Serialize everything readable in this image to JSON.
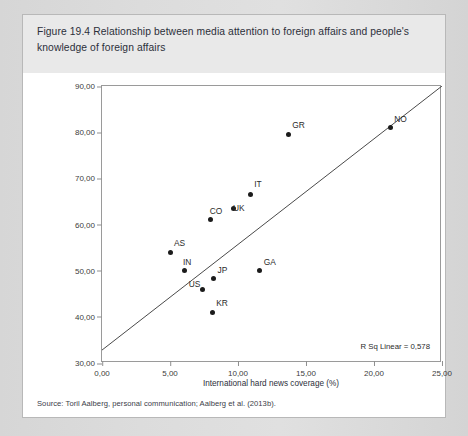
{
  "figure": {
    "caption": "Figure 19.4  Relationship between media attention to foreign affairs and people's knowledge of foreign affairs",
    "source": "Source: Toril Aalberg, personal communication; Aalberg et al. (2013b)."
  },
  "colors": {
    "page_background": "#d9d9d9",
    "figure_background": "#ffffff",
    "header_background": "#e9e9e9",
    "frame_border": "#9a9a9a",
    "point_fill": "#1b1b1b",
    "line_stroke": "#4a4a4a",
    "text": "#2c2f3a"
  },
  "chart_data": {
    "type": "scatter",
    "title": "",
    "xlabel": "International hard news coverage (%)",
    "ylabel": "International hard news knowledge (%)",
    "xlim": [
      0,
      25
    ],
    "ylim": [
      30,
      90
    ],
    "xticks": [
      "0,00",
      "5,00",
      "10,00",
      "15,00",
      "20,00",
      "25,00"
    ],
    "xtick_values": [
      0,
      5,
      10,
      15,
      20,
      25
    ],
    "yticks": [
      "30,00",
      "40,00",
      "50,00",
      "60,00",
      "70,00",
      "80,00",
      "90,00"
    ],
    "ytick_values": [
      30,
      40,
      50,
      60,
      70,
      80,
      90
    ],
    "grid": false,
    "legend": "none",
    "points": [
      {
        "label": "AS",
        "x": 5.0,
        "y": 54.0,
        "label_dx": 4,
        "label_dy": -5
      },
      {
        "label": "IN",
        "x": 6.1,
        "y": 50.0,
        "label_dx": -2,
        "label_dy": -5
      },
      {
        "label": "CO",
        "x": 8.0,
        "y": 61.0,
        "label_dx": -1,
        "label_dy": -5
      },
      {
        "label": "US",
        "x": 7.4,
        "y": 46.0,
        "label_dx": -14,
        "label_dy": -1
      },
      {
        "label": "KR",
        "x": 8.1,
        "y": 41.0,
        "label_dx": 4,
        "label_dy": -5
      },
      {
        "label": "JP",
        "x": 8.2,
        "y": 48.2,
        "label_dx": 4,
        "label_dy": -5
      },
      {
        "label": "UK",
        "x": 9.7,
        "y": 63.5,
        "label_dx": -1,
        "label_dy": 4
      },
      {
        "label": "IT",
        "x": 10.9,
        "y": 66.5,
        "label_dx": 0,
        "label_dy": -6
      },
      {
        "label": "GA",
        "x": 11.6,
        "y": 50.0,
        "label_dx": 4,
        "label_dy": -5
      },
      {
        "label": "GR",
        "x": 13.7,
        "y": 79.5,
        "label_dx": 4,
        "label_dy": -5
      },
      {
        "label": "NO",
        "x": 21.2,
        "y": 81.0,
        "label_dx": 4,
        "label_dy": -5
      }
    ],
    "fit_line": {
      "annotation": "R Sq Linear = 0,578",
      "r_squared": 0.578,
      "x_start": 0,
      "y_start": 32.8,
      "x_end": 25,
      "y_end": 90
    }
  }
}
